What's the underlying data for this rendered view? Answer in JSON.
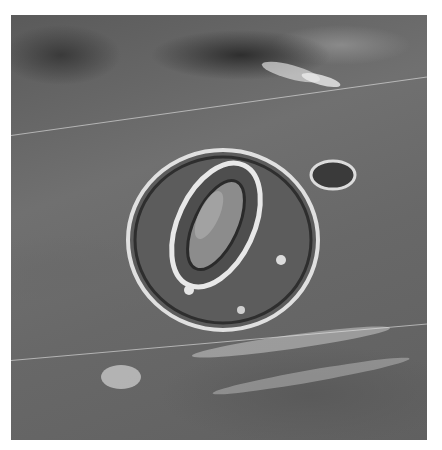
{
  "image": {
    "description": "Grayscale light micrograph of a plant stoma: two kidney-shaped guard cells surrounding an elliptical pore, encircled by subsidiary cells on a textured epidermal surface",
    "colors": {
      "background": "#ffffff",
      "surface": "#666666",
      "highlight": "#e8e8e8",
      "shadow": "#2a2a2a"
    },
    "frame": {
      "left": 11,
      "top": 15,
      "width": 416,
      "height": 425
    }
  }
}
